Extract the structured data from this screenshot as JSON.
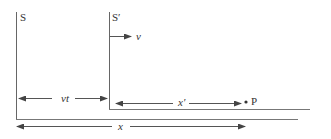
{
  "diagram": {
    "frames": [
      {
        "name": "S",
        "label": "S"
      },
      {
        "name": "S-prime",
        "label": "S′"
      }
    ],
    "velocity_label": "v",
    "distance_labels": {
      "vt": "vt",
      "x_prime": "x′",
      "x": "x"
    },
    "point_label": "P",
    "colors": {
      "line": "#555555",
      "text": "#333333"
    }
  }
}
